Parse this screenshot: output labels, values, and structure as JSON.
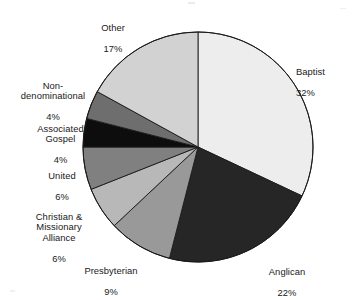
{
  "chart_data": {
    "type": "pie",
    "title": "",
    "subtitle": "",
    "xlabel": "",
    "ylabel": "",
    "grid": false,
    "legend_position": "none",
    "label_format": "name + percent",
    "start_angle_deg": 0,
    "direction": "clockwise",
    "units": "percent",
    "total": 100,
    "categories": [
      "Baptist",
      "Anglican",
      "Presbyterian",
      "Christian & Missionary Alliance",
      "United",
      "Associated Gospel",
      "Non-denominational",
      "Other"
    ],
    "values": [
      32,
      22,
      9,
      6,
      6,
      4,
      4,
      17
    ],
    "slices": [
      {
        "name": "Baptist",
        "label_lines": [
          "Baptist"
        ],
        "value": 32,
        "percent_text": "32%",
        "color": "#ededed",
        "start_deg": 0,
        "end_deg": 115.2,
        "label_align": "left"
      },
      {
        "name": "Anglican",
        "label_lines": [
          "Anglican"
        ],
        "value": 22,
        "percent_text": "22%",
        "color": "#262626",
        "start_deg": 115.2,
        "end_deg": 194.4,
        "label_align": "center"
      },
      {
        "name": "Presbyterian",
        "label_lines": [
          "Presbyterian"
        ],
        "value": 9,
        "percent_text": "9%",
        "color": "#999999",
        "start_deg": 194.4,
        "end_deg": 226.8,
        "label_align": "center"
      },
      {
        "name": "Christian & Missionary Alliance",
        "label_lines": [
          "Christian &",
          "Missionary",
          "Alliance"
        ],
        "value": 6,
        "percent_text": "6%",
        "color": "#b8b8b8",
        "start_deg": 226.8,
        "end_deg": 248.4,
        "label_align": "right"
      },
      {
        "name": "United",
        "label_lines": [
          "United"
        ],
        "value": 6,
        "percent_text": "6%",
        "color": "#808080",
        "start_deg": 248.4,
        "end_deg": 270.0,
        "label_align": "right"
      },
      {
        "name": "Associated Gospel",
        "label_lines": [
          "Associated",
          "Gospel"
        ],
        "value": 4,
        "percent_text": "4%",
        "color": "#0d0d0d",
        "start_deg": 270.0,
        "end_deg": 284.4,
        "label_align": "right"
      },
      {
        "name": "Non-denominational",
        "label_lines": [
          "Non-",
          "denominational"
        ],
        "value": 4,
        "percent_text": "4%",
        "color": "#6e6e6e",
        "start_deg": 284.4,
        "end_deg": 298.8,
        "label_align": "right"
      },
      {
        "name": "Other",
        "label_lines": [
          "Other"
        ],
        "value": 17,
        "percent_text": "17%",
        "color": "#d2d2d2",
        "start_deg": 298.8,
        "end_deg": 360.0,
        "label_align": "center"
      }
    ]
  },
  "labels": {
    "baptist": {
      "name": "Baptist",
      "pct": "32%"
    },
    "anglican": {
      "name": "Anglican",
      "pct": "22%"
    },
    "presbyterian": {
      "name": "Presbyterian",
      "pct": "9%"
    },
    "cma": {
      "name": "Christian &\nMissionary\nAlliance",
      "pct": "6%"
    },
    "united": {
      "name": "United",
      "pct": "6%"
    },
    "associated": {
      "name": "Associated\nGospel",
      "pct": "4%"
    },
    "nondenom": {
      "name": "Non-\ndenominational",
      "pct": "4%"
    },
    "other": {
      "name": "Other",
      "pct": "17%"
    }
  },
  "geometry": {
    "center_x": 198,
    "center_y": 147,
    "radius": 115
  },
  "colors": {
    "background": "#ffffff",
    "outline": "#1a1a1a",
    "text": "#191919"
  }
}
